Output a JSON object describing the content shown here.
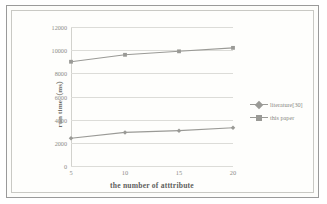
{
  "chart_data": {
    "type": "line",
    "title": "",
    "xlabel": "the number of atttribute",
    "ylabel": "run time（ms）",
    "categories": [
      "5",
      "10",
      "15",
      "20"
    ],
    "x": [
      5,
      10,
      15,
      20
    ],
    "xlim": [
      5,
      20
    ],
    "ylim": [
      0,
      12000
    ],
    "yticks": [
      "0",
      "2000",
      "4000",
      "6000",
      "8000",
      "10000",
      "12000"
    ],
    "ytick_values": [
      0,
      2000,
      4000,
      6000,
      8000,
      10000,
      12000
    ],
    "grid": "horizontal",
    "legend_position": "right",
    "series": [
      {
        "name": "literature[30]",
        "values": [
          2400,
          2900,
          3050,
          3300
        ],
        "marker": "diamond",
        "color": "#9a9a96"
      },
      {
        "name": "this paper",
        "values": [
          9000,
          9600,
          9900,
          10200
        ],
        "marker": "square",
        "color": "#9a9a96"
      }
    ]
  },
  "colors": {
    "frame_border": "#9a9a9a",
    "inner_border": "#c9c9c4",
    "gridline": "#dcdcd8",
    "tick_label": "#8d8d88",
    "axis_title": "#5f5f5c",
    "series_line": "#9a9a96",
    "background": "#fdfdfb"
  }
}
